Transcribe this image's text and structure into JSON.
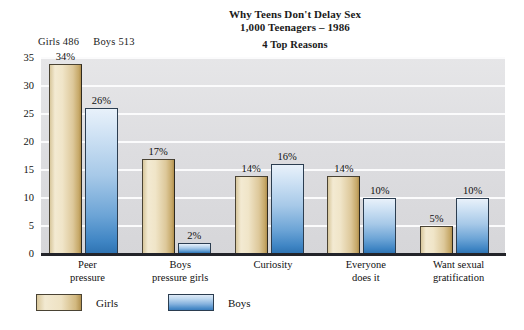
{
  "title": {
    "line1": "Why Teens Don't Delay Sex",
    "line2": "1,000 Teenagers – 1986",
    "line3": "4 Top Reasons"
  },
  "sample_header": {
    "girls": "Girls 486",
    "boys": "Boys 513"
  },
  "legend": {
    "girls_label": "Girls",
    "boys_label": "Boys"
  },
  "chart_data": {
    "type": "bar",
    "xlabel": "",
    "ylabel": "",
    "ylim": [
      0,
      35
    ],
    "yticks": [
      0,
      5,
      10,
      15,
      20,
      25,
      30,
      35
    ],
    "ytick_labels": [
      "0",
      "5",
      "10",
      "15",
      "20",
      "25",
      "30",
      "35"
    ],
    "grid": true,
    "legend_position": "bottom-left",
    "categories": [
      "Peer pressure",
      "Boys pressure girls",
      "Curiosity",
      "Everyone does it",
      "Want sexual gratification"
    ],
    "category_lines": [
      [
        "Peer",
        "pressure"
      ],
      [
        "Boys",
        "pressure girls"
      ],
      [
        "Curiosity"
      ],
      [
        "Everyone",
        "does it"
      ],
      [
        "Want sexual",
        "gratification"
      ]
    ],
    "series": [
      {
        "name": "Girls",
        "sample_size": 486,
        "color": "#e3d3a8",
        "values": [
          34,
          17,
          14,
          14,
          5
        ],
        "data_labels": [
          "34%",
          "17%",
          "14%",
          "14%",
          "5%"
        ]
      },
      {
        "name": "Boys",
        "sample_size": 513,
        "color": "#6ba3d6",
        "values": [
          26,
          2,
          16,
          10,
          10
        ],
        "data_labels": [
          "26%",
          "2%",
          "16%",
          "10%",
          "10%"
        ]
      }
    ]
  }
}
